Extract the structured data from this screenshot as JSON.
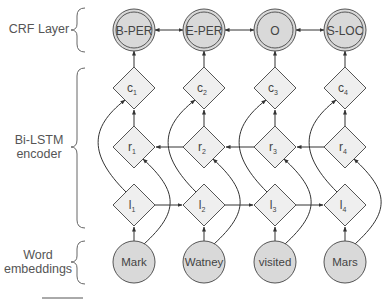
{
  "layers": {
    "crf": {
      "label": "CRF Layer"
    },
    "bilstm": {
      "label_line1": "Bi-LSTM",
      "label_line2": "encoder"
    },
    "word": {
      "label_line1": "Word",
      "label_line2": "embeddings"
    }
  },
  "crf_tags": [
    "B-PER",
    "E-PER",
    "O",
    "S-LOC"
  ],
  "combined_nodes": [
    "c",
    "c",
    "c",
    "c"
  ],
  "combined_subscripts": [
    "1",
    "2",
    "3",
    "4"
  ],
  "right_nodes": [
    "r",
    "r",
    "r",
    "r"
  ],
  "right_subscripts": [
    "1",
    "2",
    "3",
    "4"
  ],
  "left_nodes": [
    "l",
    "l",
    "l",
    "l"
  ],
  "left_subscripts": [
    "1",
    "2",
    "3",
    "4"
  ],
  "words": [
    "Mark",
    "Watney",
    "visited",
    "Mars"
  ],
  "colors": {
    "node_fill": "#d9d9d9",
    "diamond_fill": "#efefef",
    "stroke": "#555555",
    "edge": "#333333"
  }
}
